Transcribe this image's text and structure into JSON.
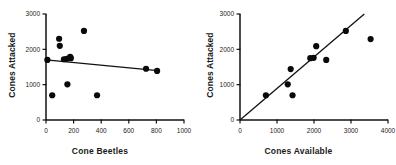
{
  "figure": {
    "type": "scatter-pair",
    "background": "#ffffff",
    "marker_color": "#0a0a0a",
    "line_color": "#111111"
  },
  "chart_data": [
    {
      "type": "scatter",
      "title": "",
      "xlabel": "Cone Beetles",
      "ylabel": "Cones Attacked",
      "xlim": [
        0,
        1000
      ],
      "ylim": [
        0,
        3000
      ],
      "xticks": [
        0,
        200,
        400,
        600,
        800,
        1000
      ],
      "yticks": [
        0,
        1000,
        2000,
        3000
      ],
      "xtick_labels": [
        "0",
        "200",
        "400",
        "600",
        "800",
        "1000"
      ],
      "ytick_labels": [
        "0",
        "1000",
        "2000",
        "3000"
      ],
      "grid": false,
      "legend": "none",
      "points": [
        {
          "x": 10,
          "y": 1700
        },
        {
          "x": 45,
          "y": 700
        },
        {
          "x": 95,
          "y": 2300
        },
        {
          "x": 100,
          "y": 2100
        },
        {
          "x": 130,
          "y": 1720
        },
        {
          "x": 150,
          "y": 1730
        },
        {
          "x": 155,
          "y": 1010
        },
        {
          "x": 175,
          "y": 1790
        },
        {
          "x": 180,
          "y": 1750
        },
        {
          "x": 275,
          "y": 2520
        },
        {
          "x": 370,
          "y": 700
        },
        {
          "x": 725,
          "y": 1450
        },
        {
          "x": 805,
          "y": 1390
        }
      ],
      "trendline": {
        "kind": "linear-fit",
        "x_start": 0,
        "y_start": 1700,
        "x_end": 810,
        "y_end": 1395,
        "slope": -0.377,
        "intercept": 1700,
        "direction": "negative"
      }
    },
    {
      "type": "scatter",
      "title": "",
      "xlabel": "Cones Available",
      "ylabel": "Cones Attacked",
      "xlim": [
        0,
        4000
      ],
      "ylim": [
        0,
        3000
      ],
      "xticks": [
        0,
        1000,
        2000,
        3000,
        4000
      ],
      "yticks": [
        0,
        1000,
        2000,
        3000
      ],
      "xtick_labels": [
        "0",
        "1000",
        "2000",
        "3000",
        "4000"
      ],
      "ytick_labels": [
        "0",
        "1000",
        "2000",
        "3000"
      ],
      "grid": false,
      "legend": "none",
      "points": [
        {
          "x": 700,
          "y": 700
        },
        {
          "x": 1290,
          "y": 1010
        },
        {
          "x": 1370,
          "y": 1440
        },
        {
          "x": 1420,
          "y": 700
        },
        {
          "x": 1900,
          "y": 1750
        },
        {
          "x": 1990,
          "y": 1760
        },
        {
          "x": 2060,
          "y": 2090
        },
        {
          "x": 2330,
          "y": 1700
        },
        {
          "x": 2860,
          "y": 2520
        },
        {
          "x": 3530,
          "y": 2290
        }
      ],
      "trendline": {
        "kind": "linear-fit",
        "x_start": 0,
        "y_start": 0,
        "x_end": 3360,
        "y_end": 3000,
        "slope": 0.893,
        "intercept": 0,
        "direction": "positive"
      }
    }
  ]
}
